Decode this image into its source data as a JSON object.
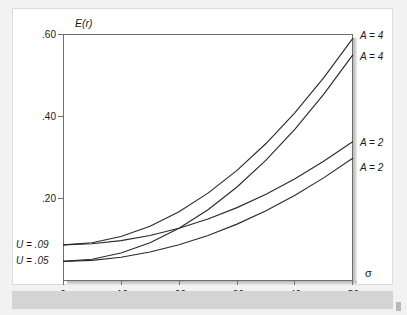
{
  "figure": {
    "y_axis_title": "E(r)",
    "x_axis_title": "σ"
  },
  "chart_data": {
    "type": "line",
    "title": "",
    "xlabel": "σ",
    "ylabel": "E(r)",
    "xlim": [
      0,
      0.5
    ],
    "ylim": [
      0,
      0.6
    ],
    "grid": false,
    "legend_position": "right-of-plot",
    "x_ticks": [
      0,
      0.1,
      0.2,
      0.3,
      0.4,
      0.5
    ],
    "x_tick_labels": [
      "0",
      ".10",
      ".20",
      ".30",
      ".40",
      ".50"
    ],
    "y_ticks": [
      0.2,
      0.4,
      0.6
    ],
    "y_tick_labels": [
      ".20",
      ".40",
      ".60"
    ],
    "y_special_labels": [
      {
        "value": 0.09,
        "text": "U = .09"
      },
      {
        "value": 0.05,
        "text": "U = .05"
      }
    ],
    "note": "Indifference curves E(r) = U + 0.5*A*sigma^2",
    "series": [
      {
        "name": "A = 4, U = .09",
        "label": "A = 4",
        "utility": 0.09,
        "risk_aversion": 4,
        "x": [
          0,
          0.05,
          0.1,
          0.15,
          0.2,
          0.25,
          0.3,
          0.35,
          0.4,
          0.45,
          0.5
        ],
        "values": [
          0.09,
          0.095,
          0.11,
          0.135,
          0.17,
          0.215,
          0.27,
          0.335,
          0.41,
          0.495,
          0.59
        ]
      },
      {
        "name": "A = 4, U = .05",
        "label": "A = 4",
        "utility": 0.05,
        "risk_aversion": 4,
        "x": [
          0,
          0.05,
          0.1,
          0.15,
          0.2,
          0.25,
          0.3,
          0.35,
          0.4,
          0.45,
          0.5
        ],
        "values": [
          0.05,
          0.055,
          0.07,
          0.095,
          0.13,
          0.175,
          0.23,
          0.295,
          0.37,
          0.455,
          0.55
        ]
      },
      {
        "name": "A = 2, U = .09",
        "label": "A = 2",
        "utility": 0.09,
        "risk_aversion": 2,
        "x": [
          0,
          0.05,
          0.1,
          0.15,
          0.2,
          0.25,
          0.3,
          0.35,
          0.4,
          0.45,
          0.5
        ],
        "values": [
          0.09,
          0.0925,
          0.1,
          0.1125,
          0.13,
          0.1525,
          0.18,
          0.2125,
          0.25,
          0.2925,
          0.34
        ]
      },
      {
        "name": "A = 2, U = .05",
        "label": "A = 2",
        "utility": 0.05,
        "risk_aversion": 2,
        "x": [
          0,
          0.05,
          0.1,
          0.15,
          0.2,
          0.25,
          0.3,
          0.35,
          0.4,
          0.45,
          0.5
        ],
        "values": [
          0.05,
          0.0525,
          0.06,
          0.0725,
          0.09,
          0.1125,
          0.14,
          0.1725,
          0.21,
          0.2525,
          0.3
        ]
      }
    ],
    "curve_labels_right": [
      "A = 4",
      "A = 4",
      "A = 2",
      "A = 2"
    ]
  },
  "colors": {
    "curve": "#2b2b2b",
    "axis": "#6f6f6f",
    "page_tint": "#f2f2f2",
    "panel": "#ffffff",
    "band": "#d4d4d4"
  }
}
